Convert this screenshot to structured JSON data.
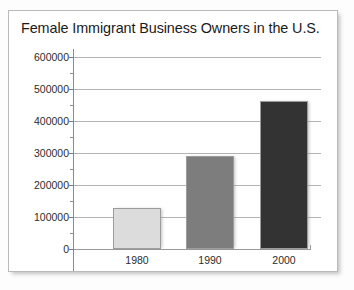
{
  "chart_data": {
    "type": "bar",
    "title": "Female Immigrant Business Owners in the U.S.",
    "xlabel": "",
    "ylabel": "",
    "categories": [
      "1980",
      "1990",
      "2000"
    ],
    "values": [
      127000,
      291000,
      461000
    ],
    "series": [
      {
        "name": "Female Immigrant Business Owners",
        "values": [
          127000,
          291000,
          461000
        ]
      }
    ],
    "bar_colors": [
      "#dcdcdc",
      "#7d7d7d",
      "#333333"
    ],
    "ylim": [
      0,
      600000
    ],
    "ytick_labels": [
      "0",
      "100000",
      "200000",
      "300000",
      "400000",
      "500000",
      "600000"
    ],
    "ytick_values": [
      0,
      100000,
      200000,
      300000,
      400000,
      500000,
      600000
    ],
    "yminor_tick_values": [
      50000,
      150000,
      250000,
      350000,
      450000,
      550000
    ],
    "grid": true,
    "grid_axis": "y",
    "legend": false,
    "legend_position": "none"
  },
  "figure": {
    "title": "Female Immigrant Business Owners in the U.S.",
    "background_color": "#ffffff",
    "border_color": "#b9b9b9",
    "grid_color": "#b4b4b4",
    "axis_color": "#8c8c8c",
    "text_color": "#1a1a1a"
  }
}
